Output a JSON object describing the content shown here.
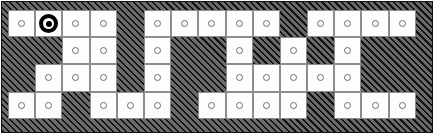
{
  "figure": {
    "name": "occupancy-grid-map",
    "rows": 4,
    "cols": 15,
    "legend": {
      "open_label": "free cell",
      "blocked_label": "obstacle cell",
      "target_label": "goal node"
    },
    "colors": {
      "open_fill": "#fdfdfd",
      "open_border": "#8d8d8f",
      "node_ring": "#6e6e70",
      "hatch_base": "#58585a",
      "hatch_line": "#111111",
      "frame": "#111111",
      "target": "#000000"
    }
  },
  "grid": {
    "cells": [
      [
        {
          "state": "open"
        },
        {
          "state": "target"
        },
        {
          "state": "open"
        },
        {
          "state": "open"
        },
        {
          "state": "blocked"
        },
        {
          "state": "open"
        },
        {
          "state": "open"
        },
        {
          "state": "open"
        },
        {
          "state": "open"
        },
        {
          "state": "open"
        },
        {
          "state": "blocked"
        },
        {
          "state": "open"
        },
        {
          "state": "open"
        },
        {
          "state": "open"
        },
        {
          "state": "open"
        }
      ],
      [
        {
          "state": "blocked"
        },
        {
          "state": "blocked"
        },
        {
          "state": "open"
        },
        {
          "state": "open"
        },
        {
          "state": "blocked"
        },
        {
          "state": "open"
        },
        {
          "state": "blocked"
        },
        {
          "state": "blocked"
        },
        {
          "state": "open"
        },
        {
          "state": "blocked"
        },
        {
          "state": "open"
        },
        {
          "state": "blocked"
        },
        {
          "state": "open"
        },
        {
          "state": "blocked"
        },
        {
          "state": "blocked"
        }
      ],
      [
        {
          "state": "blocked"
        },
        {
          "state": "open"
        },
        {
          "state": "open"
        },
        {
          "state": "open"
        },
        {
          "state": "blocked"
        },
        {
          "state": "open"
        },
        {
          "state": "blocked"
        },
        {
          "state": "blocked"
        },
        {
          "state": "open"
        },
        {
          "state": "open"
        },
        {
          "state": "open"
        },
        {
          "state": "open"
        },
        {
          "state": "open"
        },
        {
          "state": "blocked"
        },
        {
          "state": "blocked"
        }
      ],
      [
        {
          "state": "open"
        },
        {
          "state": "open"
        },
        {
          "state": "blocked"
        },
        {
          "state": "open"
        },
        {
          "state": "open"
        },
        {
          "state": "open"
        },
        {
          "state": "blocked"
        },
        {
          "state": "open"
        },
        {
          "state": "open"
        },
        {
          "state": "open"
        },
        {
          "state": "open"
        },
        {
          "state": "blocked"
        },
        {
          "state": "open"
        },
        {
          "state": "open"
        },
        {
          "state": "open"
        }
      ]
    ]
  }
}
